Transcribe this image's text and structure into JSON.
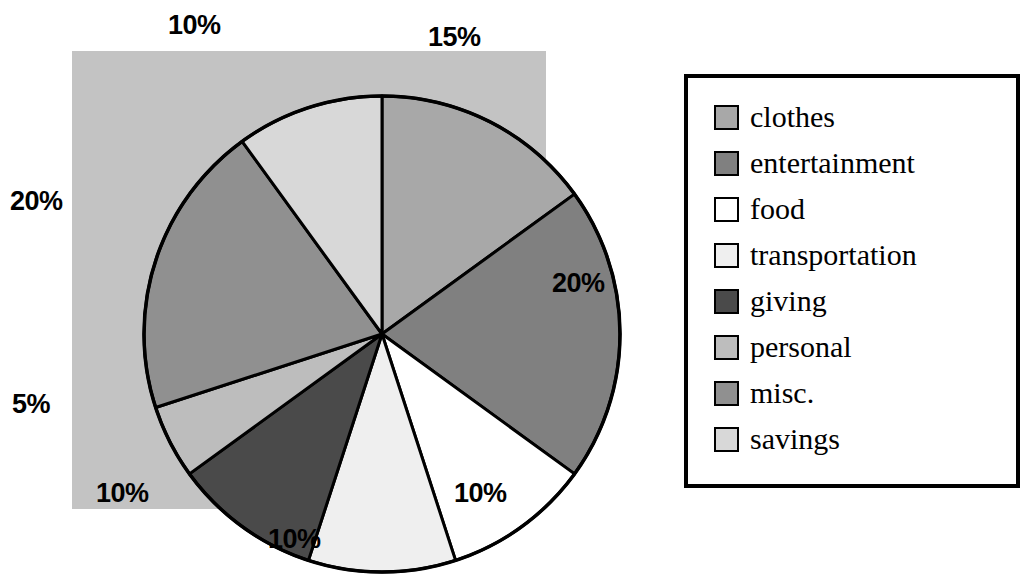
{
  "chart_data": {
    "type": "pie",
    "title": "",
    "subtitle": "",
    "xlabel": "",
    "ylabel": "",
    "legend_position": "right",
    "grid": false,
    "start_angle_deg": 0,
    "direction": "clockwise",
    "categories": [
      "clothes",
      "entertainment",
      "food",
      "transportation",
      "giving",
      "personal",
      "misc.",
      "savings"
    ],
    "values": [
      15,
      20,
      10,
      10,
      10,
      5,
      20,
      10
    ],
    "value_labels": [
      "15%",
      "20%",
      "10%",
      "10%",
      "10%",
      "5%",
      "20%",
      "10%"
    ],
    "slice_colors": [
      "#a8a8a8",
      "#808080",
      "#ffffff",
      "#efefef",
      "#4a4a4a",
      "#bdbdbd",
      "#909090",
      "#d8d8d8"
    ],
    "slices": [
      {
        "label": "clothes",
        "value": 15,
        "value_label": "15%",
        "color": "#a8a8a8",
        "start_deg": 0,
        "end_deg": 54
      },
      {
        "label": "entertainment",
        "value": 20,
        "value_label": "20%",
        "color": "#808080",
        "start_deg": 54,
        "end_deg": 126
      },
      {
        "label": "food",
        "value": 10,
        "value_label": "10%",
        "color": "#ffffff",
        "start_deg": 126,
        "end_deg": 162
      },
      {
        "label": "transportation",
        "value": 10,
        "value_label": "10%",
        "color": "#efefef",
        "start_deg": 162,
        "end_deg": 198
      },
      {
        "label": "giving",
        "value": 10,
        "value_label": "10%",
        "color": "#4a4a4a",
        "start_deg": 198,
        "end_deg": 234
      },
      {
        "label": "personal",
        "value": 5,
        "value_label": "5%",
        "color": "#bdbdbd",
        "start_deg": 234,
        "end_deg": 252
      },
      {
        "label": "misc.",
        "value": 20,
        "value_label": "20%",
        "color": "#909090",
        "start_deg": 252,
        "end_deg": 324
      },
      {
        "label": "savings",
        "value": 10,
        "value_label": "10%",
        "color": "#d8d8d8",
        "start_deg": 324,
        "end_deg": 360
      }
    ],
    "plot_background": "#c3c3c3",
    "outline_color": "#000000"
  },
  "pie": {
    "labels": [
      {
        "text": "10%",
        "left": 168,
        "top": 10,
        "category": "savings"
      },
      {
        "text": "15%",
        "left": 428,
        "top": 22,
        "category": "clothes"
      },
      {
        "text": "20%",
        "left": 552,
        "top": 268,
        "category": "entertainment"
      },
      {
        "text": "10%",
        "left": 454,
        "top": 478,
        "category": "food"
      },
      {
        "text": "10%",
        "left": 268,
        "top": 524,
        "category": "transportation"
      },
      {
        "text": "10%",
        "left": 96,
        "top": 478,
        "category": "giving"
      },
      {
        "text": "5%",
        "left": 12,
        "top": 389,
        "category": "personal"
      },
      {
        "text": "20%",
        "left": 10,
        "top": 186,
        "category": "misc."
      }
    ]
  },
  "legend": {
    "items": [
      {
        "label": "clothes",
        "color": "#a8a8a8"
      },
      {
        "label": "entertainment",
        "color": "#808080"
      },
      {
        "label": "food",
        "color": "#ffffff"
      },
      {
        "label": "transportation",
        "color": "#efefef"
      },
      {
        "label": "giving",
        "color": "#4a4a4a"
      },
      {
        "label": "personal",
        "color": "#bdbdbd"
      },
      {
        "label": "misc.",
        "color": "#909090"
      },
      {
        "label": "savings",
        "color": "#d8d8d8"
      }
    ]
  }
}
